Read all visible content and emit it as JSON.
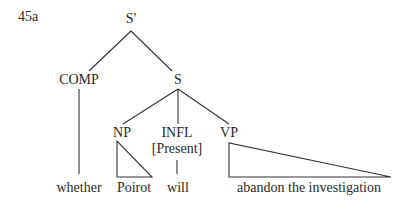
{
  "example_number": "45a",
  "tree": {
    "root": {
      "label": "S'"
    },
    "comp": {
      "label": "COMP",
      "word": "whether"
    },
    "s": {
      "label": "S"
    },
    "np": {
      "label": "NP",
      "word": "Poirot"
    },
    "infl": {
      "label": "INFL",
      "feature": "[Present]",
      "word": "will"
    },
    "vp": {
      "label": "VP",
      "word": "abandon the investigation"
    }
  },
  "colors": {
    "ink": "#2a2a2a",
    "background": "#ffffff"
  }
}
